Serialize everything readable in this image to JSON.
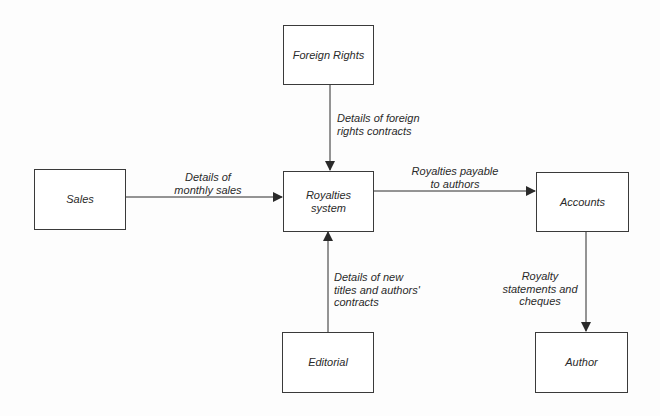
{
  "diagram": {
    "type": "context-diagram",
    "nodes": {
      "foreign_rights": {
        "label": "Foreign Rights"
      },
      "sales": {
        "label": "Sales"
      },
      "royalties": {
        "label": "Royalties\nsystem"
      },
      "accounts": {
        "label": "Accounts"
      },
      "editorial": {
        "label": "Editorial"
      },
      "author": {
        "label": "Author"
      }
    },
    "edges": {
      "foreign_to_royalties": {
        "from": "Foreign Rights",
        "to": "Royalties system",
        "label": "Details of foreign\nrights contracts"
      },
      "sales_to_royalties": {
        "from": "Sales",
        "to": "Royalties system",
        "label": "Details of\nmonthly sales"
      },
      "royalties_to_accounts": {
        "from": "Royalties system",
        "to": "Accounts",
        "label": "Royalties payable\nto authors"
      },
      "editorial_to_royalties": {
        "from": "Editorial",
        "to": "Royalties system",
        "label": "Details of new\ntitles and authors'\ncontracts"
      },
      "accounts_to_author": {
        "from": "Accounts",
        "to": "Author",
        "label": "Royalty\nstatements and\ncheques"
      }
    },
    "colors": {
      "line": "#2a2a2a",
      "box_border": "#3a3a3a",
      "background": "#fdfdfd"
    }
  }
}
